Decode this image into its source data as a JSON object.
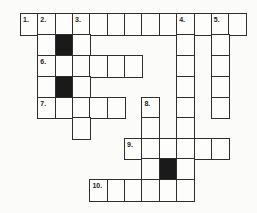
{
  "puzzle": {
    "type": "crossword",
    "grid_origin": {
      "x": 20,
      "y": 13
    },
    "cell_width": 17.35,
    "row_tops": [
      13,
      34,
      55,
      76,
      97,
      117,
      138,
      158,
      179
    ],
    "row_height": 21,
    "colors": {
      "line": "#2e2e2e",
      "cell": "#fdfdfc",
      "block": "#1a1a1a",
      "background": "#fbfbf9"
    },
    "cells": [
      {
        "r": 0,
        "c": 0,
        "num": "1."
      },
      {
        "r": 0,
        "c": 1,
        "num": "2."
      },
      {
        "r": 0,
        "c": 2
      },
      {
        "r": 0,
        "c": 3,
        "num": "3."
      },
      {
        "r": 0,
        "c": 4
      },
      {
        "r": 0,
        "c": 5
      },
      {
        "r": 0,
        "c": 6
      },
      {
        "r": 0,
        "c": 7
      },
      {
        "r": 0,
        "c": 8
      },
      {
        "r": 0,
        "c": 9,
        "num": "4."
      },
      {
        "r": 0,
        "c": 10
      },
      {
        "r": 0,
        "c": 11,
        "num": "5."
      },
      {
        "r": 0,
        "c": 12
      },
      {
        "r": 1,
        "c": 1
      },
      {
        "r": 1,
        "c": 2,
        "black": true
      },
      {
        "r": 1,
        "c": 3
      },
      {
        "r": 1,
        "c": 9
      },
      {
        "r": 1,
        "c": 11
      },
      {
        "r": 2,
        "c": 1,
        "num": "6."
      },
      {
        "r": 2,
        "c": 2
      },
      {
        "r": 2,
        "c": 3
      },
      {
        "r": 2,
        "c": 4
      },
      {
        "r": 2,
        "c": 5
      },
      {
        "r": 2,
        "c": 6
      },
      {
        "r": 2,
        "c": 9
      },
      {
        "r": 2,
        "c": 11
      },
      {
        "r": 3,
        "c": 1
      },
      {
        "r": 3,
        "c": 2,
        "black": true
      },
      {
        "r": 3,
        "c": 3
      },
      {
        "r": 3,
        "c": 9
      },
      {
        "r": 3,
        "c": 11
      },
      {
        "r": 4,
        "c": 1,
        "num": "7."
      },
      {
        "r": 4,
        "c": 2
      },
      {
        "r": 4,
        "c": 3
      },
      {
        "r": 4,
        "c": 4
      },
      {
        "r": 4,
        "c": 5
      },
      {
        "r": 4,
        "c": 7,
        "num": "8."
      },
      {
        "r": 4,
        "c": 9
      },
      {
        "r": 4,
        "c": 11
      },
      {
        "r": 5,
        "c": 3
      },
      {
        "r": 5,
        "c": 7
      },
      {
        "r": 5,
        "c": 9
      },
      {
        "r": 6,
        "c": 6,
        "num": "9."
      },
      {
        "r": 6,
        "c": 7
      },
      {
        "r": 6,
        "c": 8
      },
      {
        "r": 6,
        "c": 9
      },
      {
        "r": 6,
        "c": 10
      },
      {
        "r": 6,
        "c": 11
      },
      {
        "r": 7,
        "c": 7
      },
      {
        "r": 7,
        "c": 8,
        "black": true
      },
      {
        "r": 7,
        "c": 9
      },
      {
        "r": 8,
        "c": 4,
        "num": "10."
      },
      {
        "r": 8,
        "c": 5
      },
      {
        "r": 8,
        "c": 6
      },
      {
        "r": 8,
        "c": 7
      },
      {
        "r": 8,
        "c": 8
      },
      {
        "r": 8,
        "c": 9
      }
    ],
    "clue_numbers": [
      "1.",
      "2.",
      "3.",
      "4.",
      "5.",
      "6.",
      "7.",
      "8.",
      "9.",
      "10."
    ]
  }
}
